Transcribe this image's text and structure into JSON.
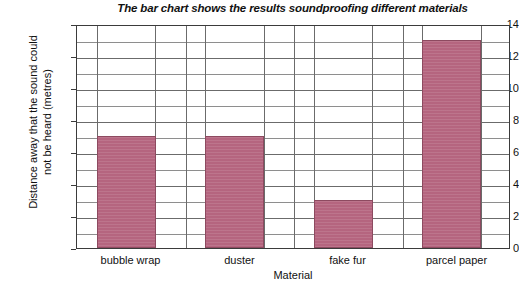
{
  "chart_data": {
    "type": "bar",
    "title": "The bar chart shows the results soundproofing different materials",
    "xlabel": "Material",
    "ylabel": "Distance away that the sound could not be heard (metres)",
    "ylabel_line1": "Distance away that the sound could",
    "ylabel_line2": "not be heard (metres)",
    "categories": [
      "bubble wrap",
      "duster",
      "fake fur",
      "parcel paper"
    ],
    "values": [
      7,
      7,
      3,
      13
    ],
    "ylim": [
      0,
      14
    ],
    "y_major_ticks": [
      0,
      2,
      4,
      6,
      8,
      10,
      12,
      14
    ],
    "y_tick_labels": [
      "0",
      "2",
      "4",
      "6",
      "8",
      "10",
      "12",
      "14"
    ],
    "y_minor_gridlines": [
      1,
      3,
      5,
      7,
      9,
      11,
      13
    ],
    "grid": "horizontal-and-vertical",
    "legend": "none",
    "bar_color": "#b5657f",
    "bar_edge_color": "#8d4a60",
    "grid_color": "#8e8e8e",
    "axis_color": "#3b3b3b",
    "background_color": "#ffffff"
  }
}
